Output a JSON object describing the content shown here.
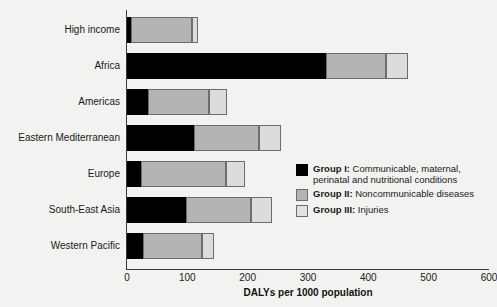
{
  "chart_data": {
    "type": "bar",
    "orientation": "horizontal",
    "stacked": true,
    "title": "",
    "xlabel": "DALYs per 1000 population",
    "ylabel": "",
    "xlim": [
      0,
      600
    ],
    "xticks": [
      0,
      100,
      200,
      300,
      400,
      500,
      600
    ],
    "grid": false,
    "legend_position": "inside-right",
    "categories": [
      "High income",
      "Africa",
      "Americas",
      "Eastern Mediterranean",
      "Europe",
      "South-East Asia",
      "Western Pacific"
    ],
    "series": [
      {
        "name": "Group I: Communicable, maternal, perinatal and nutritional conditions",
        "short_name": "Group I",
        "color": "#000000",
        "values": [
          7,
          330,
          34,
          111,
          23,
          98,
          27
        ]
      },
      {
        "name": "Group II: Noncommunicable diseases",
        "short_name": "Group II",
        "color": "#b4b4b4",
        "values": [
          101,
          100,
          102,
          107,
          141,
          108,
          97
        ]
      },
      {
        "name": "Group III: Injuries",
        "short_name": "Group III",
        "color": "#dcdcdc",
        "values": [
          9,
          35,
          29,
          38,
          32,
          35,
          21
        ]
      }
    ],
    "totals": [
      117,
      465,
      165,
      256,
      196,
      241,
      145
    ]
  },
  "axis": {
    "x_title": "DALYs per 1000 population",
    "tick_labels": [
      "0",
      "100",
      "200",
      "300",
      "400",
      "500",
      "600"
    ]
  },
  "legend": {
    "items": [
      {
        "swatch": "g1",
        "bold": "Group I:",
        "line1": " Communicable, maternal,",
        "line2": "perinatal and nutritional conditions"
      },
      {
        "swatch": "g2",
        "bold": "Group II:",
        "line1": " Noncommunicable diseases",
        "line2": ""
      },
      {
        "swatch": "g3",
        "bold": "Group III:",
        "line1": " Injuries",
        "line2": ""
      }
    ]
  }
}
